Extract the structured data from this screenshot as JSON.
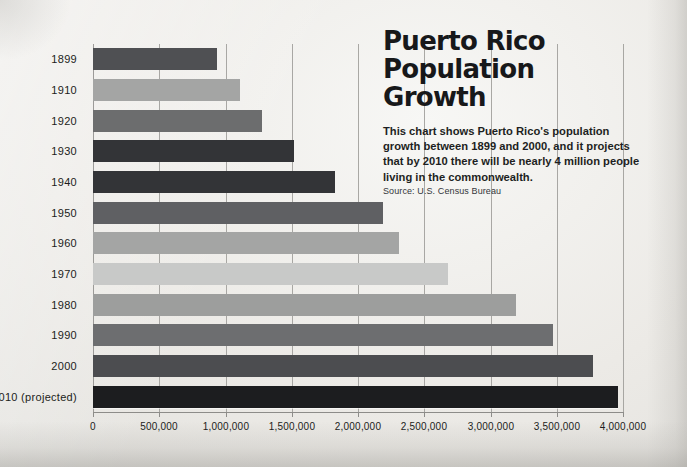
{
  "headline": {
    "line1": "Puerto Rico",
    "line2": "Population",
    "line3": "Growth"
  },
  "blurb": "This chart shows Puerto Rico's population growth between 1899 and 2000, and it projects that by 2010 there will be nearly 4 million people living in the commonwealth.",
  "source": "Source: U.S. Census Bureau",
  "chart_data": {
    "type": "bar",
    "orientation": "horizontal",
    "title": "Puerto Rico Population Growth",
    "subtitle": "This chart shows Puerto Rico's population growth between 1899 and 2000, and it projects that by 2010 there will be nearly 4 million people living in the commonwealth.",
    "source": "Source: U.S. Census Bureau",
    "xlabel": "",
    "ylabel": "",
    "xlim": [
      0,
      4000000
    ],
    "xticks": [
      0,
      500000,
      1000000,
      1500000,
      2000000,
      2500000,
      3000000,
      3500000,
      4000000
    ],
    "xtick_labels": [
      "0",
      "500,000",
      "1,000,000",
      "1,500,000",
      "2,000,000",
      "2,500,000",
      "3,000,000",
      "3,500,000",
      "4,000,000"
    ],
    "grid": true,
    "grid_axis": "x",
    "legend": "none",
    "categories": [
      "1899",
      "1910",
      "1920",
      "1930",
      "1940",
      "1950",
      "1960",
      "1970",
      "1980",
      "1990",
      "2000",
      "2010 (projected)"
    ],
    "values": [
      935000,
      1110000,
      1275000,
      1520000,
      1830000,
      2190000,
      2310000,
      2680000,
      3190000,
      3470000,
      3770000,
      3960000
    ],
    "bar_colors": [
      "#4f5053",
      "#a4a5a4",
      "#6c6d6e",
      "#333437",
      "#333437",
      "#5f6063",
      "#a4a5a4",
      "#c8c9c8",
      "#9d9e9d",
      "#6d6e70",
      "#4c4d50",
      "#1c1d1f"
    ],
    "bars": [
      {
        "category": "1899",
        "value": 935000,
        "color": "#4f5053"
      },
      {
        "category": "1910",
        "value": 1110000,
        "color": "#a4a5a4"
      },
      {
        "category": "1920",
        "value": 1275000,
        "color": "#6c6d6e"
      },
      {
        "category": "1930",
        "value": 1520000,
        "color": "#333437"
      },
      {
        "category": "1940",
        "value": 1830000,
        "color": "#333437"
      },
      {
        "category": "1950",
        "value": 2190000,
        "color": "#5f6063"
      },
      {
        "category": "1960",
        "value": 2310000,
        "color": "#a4a5a4"
      },
      {
        "category": "1970",
        "value": 2680000,
        "color": "#c8c9c8"
      },
      {
        "category": "1980",
        "value": 3190000,
        "color": "#9d9e9d"
      },
      {
        "category": "1990",
        "value": 3470000,
        "color": "#6d6e70"
      },
      {
        "category": "2000",
        "value": 3770000,
        "color": "#4c4d50"
      },
      {
        "category": "2010 (projected)",
        "value": 3960000,
        "color": "#1c1d1f"
      }
    ]
  },
  "colors": {
    "page_background": "#eceae6",
    "text": "#1c1d20",
    "gridline": "#9b9a97",
    "axis": "#8d8c89"
  }
}
